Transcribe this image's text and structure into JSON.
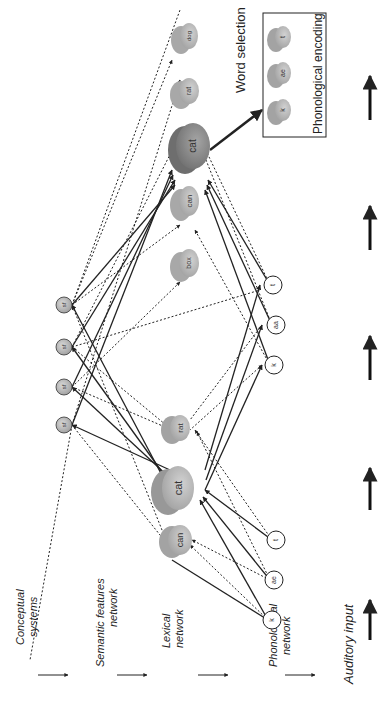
{
  "levels": {
    "conceptual": [
      "Conceptual",
      "systems"
    ],
    "semantic": [
      "Semantic features",
      "network"
    ],
    "lexical": [
      "Lexical",
      "network"
    ],
    "phonological": [
      "Phonological",
      "network"
    ],
    "auditory": "Auditory input"
  },
  "word_selection": "Word selection",
  "phonological_encoding": "Phonological encoding",
  "phase1": {
    "phonemes": [
      "k",
      "ae",
      "t"
    ],
    "lexical": [
      "can",
      "cat",
      "rat"
    ]
  },
  "phase2": {
    "semantic": [
      "sf",
      "sf",
      "sf",
      "sf"
    ],
    "phonemes": [
      "k",
      "aa",
      "t"
    ],
    "lexical": [
      "box",
      "can",
      "cat",
      "rat",
      "dog"
    ]
  },
  "encoding_phonemes": [
    "k",
    "ae",
    "t"
  ],
  "colors": {
    "node_fill": "#b4b4b4",
    "node_dark": "#8a8a8a",
    "selected_fill": "#8f8f8f",
    "line": "#222222"
  }
}
